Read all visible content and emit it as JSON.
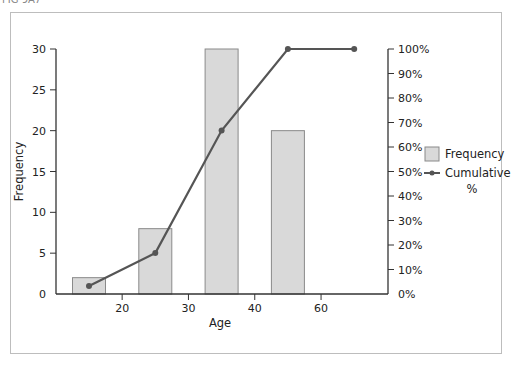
{
  "figure_label": "FIG 9A7",
  "chart_data": {
    "type": "bar",
    "title": "",
    "xlabel": "Age",
    "ylabel": "Frequency",
    "y2label": "",
    "categories": [
      "15",
      "25",
      "35",
      "45",
      "55"
    ],
    "x_tick_labels": [
      "20",
      "30",
      "40",
      "60"
    ],
    "ylim": [
      0,
      30
    ],
    "y_ticks": [
      0,
      5,
      10,
      15,
      20,
      25,
      30
    ],
    "y2lim": [
      0,
      100
    ],
    "y2_ticks": [
      "0%",
      "10%",
      "20%",
      "30%",
      "40%",
      "50%",
      "60%",
      "70%",
      "80%",
      "90%",
      "100%"
    ],
    "series": [
      {
        "name": "Frequency",
        "type": "bar",
        "axis": "left",
        "values": [
          2,
          8,
          30,
          20,
          null
        ],
        "color": "#d9d9d9"
      },
      {
        "name": "Cumulative %",
        "type": "line",
        "axis": "right",
        "values": [
          3.3,
          16.7,
          66.7,
          100,
          100
        ],
        "color": "#555555"
      }
    ],
    "legend": {
      "position": "right",
      "entries": [
        "Frequency",
        "Cumulative",
        "%"
      ]
    },
    "grid": false
  }
}
